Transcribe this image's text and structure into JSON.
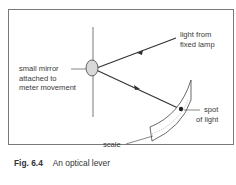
{
  "figure": {
    "number_label": "Fig. 6.4",
    "title": "An optical lever"
  },
  "labels": {
    "light_source": [
      "light from",
      "fixed lamp"
    ],
    "mirror": [
      "small mirror",
      "attached to",
      "meter movement"
    ],
    "spot": [
      "spot",
      "of light"
    ],
    "scale": "scale"
  },
  "colors": {
    "border": "#7a7a7a",
    "line": "#333333",
    "mirror_fill": "#d9d9d9",
    "text": "#3a3a3a"
  }
}
